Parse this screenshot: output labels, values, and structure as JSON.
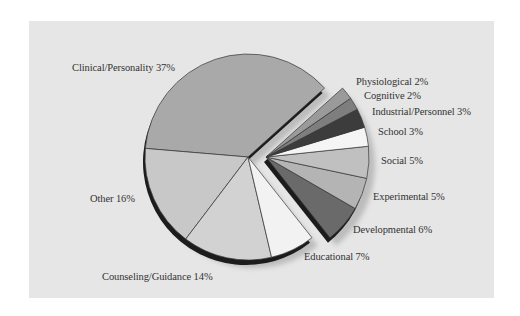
{
  "chart_data": {
    "type": "pie",
    "title": "",
    "exploded_group": [
      "Physiological",
      "Cognitive",
      "Industrial/Personnel",
      "School",
      "Social",
      "Experimental",
      "Developmental"
    ],
    "categories": [
      "Clinical/Personality",
      "Other",
      "Counseling/Guidance",
      "Educational",
      "Developmental",
      "Experimental",
      "Social",
      "School",
      "Industrial/Personnel",
      "Cognitive",
      "Physiological"
    ],
    "values": [
      37,
      16,
      14,
      7,
      6,
      5,
      5,
      3,
      3,
      2,
      2
    ],
    "unit": "%",
    "colors": [
      "#a9a9a9",
      "#c8c8c8",
      "#d2d2d2",
      "#f2f2f2",
      "#6a6a6a",
      "#b4b4b4",
      "#c0c0c0",
      "#f5f5f5",
      "#3c3c3c",
      "#7e7e7e",
      "#9a9a9a"
    ],
    "legend": "none (direct labels)"
  },
  "labels": {
    "clinical": "Clinical/Personality 37%",
    "other": "Other 16%",
    "counseling": "Counseling/Guidance 14%",
    "educational": "Educational 7%",
    "developmental": "Developmental 6%",
    "experimental": "Experimental 5%",
    "social": "Social 5%",
    "school": "School 3%",
    "industrial": "Industrial/Personnel 3%",
    "cognitive": "Cognitive 2%",
    "physiological": "Physiological 2%"
  },
  "colors": {
    "panel_background": "#e6e6e6",
    "page_background": "#ffffff",
    "slice_outline": "#3a3a3a",
    "depth_edge": "#1c1c1c"
  }
}
